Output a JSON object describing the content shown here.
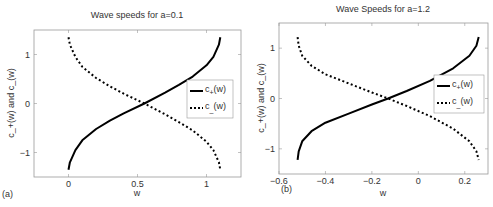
{
  "figure": {
    "panel_a_label": "(a)",
    "panel_b_label": "(b)"
  },
  "chart_data": [
    {
      "type": "line",
      "panel": "(a)",
      "title": "Wave speeds for a=0.1",
      "xlabel": "w",
      "ylabel": "c_+(w) and c_(w)",
      "xlim": [
        -0.25,
        1.25
      ],
      "ylim": [
        -1.5,
        1.5
      ],
      "xticks": [
        0,
        0.5,
        1
      ],
      "xtick_labels": [
        "0",
        "0.5",
        "1"
      ],
      "yticks": [
        -1,
        0,
        1
      ],
      "ytick_labels": [
        "-1",
        "0",
        "1"
      ],
      "grid": false,
      "legend": {
        "position": "right-center",
        "entries": [
          "c+(w)",
          "c-(w)"
        ]
      },
      "series": [
        {
          "name": "c+(w)",
          "style": "solid",
          "x": [
            0.0,
            0.01,
            0.05,
            0.1,
            0.2,
            0.3,
            0.4,
            0.55,
            0.7,
            0.8,
            0.9,
            1.0,
            1.05,
            1.09,
            1.1
          ],
          "y": [
            -1.35,
            -1.2,
            -0.95,
            -0.75,
            -0.52,
            -0.35,
            -0.2,
            0.0,
            0.22,
            0.38,
            0.55,
            0.78,
            0.95,
            1.2,
            1.35
          ]
        },
        {
          "name": "c-(w)",
          "style": "dashed",
          "x": [
            0.0,
            0.01,
            0.05,
            0.1,
            0.2,
            0.3,
            0.4,
            0.55,
            0.7,
            0.8,
            0.9,
            1.0,
            1.05,
            1.09,
            1.1
          ],
          "y": [
            1.35,
            1.2,
            0.95,
            0.75,
            0.52,
            0.35,
            0.2,
            0.0,
            -0.22,
            -0.38,
            -0.55,
            -0.78,
            -0.95,
            -1.2,
            -1.35
          ]
        }
      ]
    },
    {
      "type": "line",
      "panel": "(b)",
      "title": "Wave Speeds for a=1.2",
      "xlabel": "w",
      "ylabel": "c_+(w) and c_(w)",
      "xlim": [
        -0.6,
        0.3
      ],
      "ylim": [
        -1.5,
        1.5
      ],
      "xticks": [
        -0.6,
        -0.4,
        -0.2,
        0,
        0.2
      ],
      "xtick_labels": [
        "-0.6",
        "-0.4",
        "-0.2",
        "0",
        "0.2"
      ],
      "yticks": [
        -1,
        0,
        1
      ],
      "ytick_labels": [
        "-1",
        "0",
        "1"
      ],
      "grid": false,
      "legend": {
        "position": "right-center",
        "entries": [
          "c+(w)",
          "c-(w)"
        ]
      },
      "series": [
        {
          "name": "c+(w)",
          "style": "solid",
          "x": [
            -0.52,
            -0.515,
            -0.5,
            -0.46,
            -0.4,
            -0.3,
            -0.2,
            -0.13,
            -0.05,
            0.05,
            0.15,
            0.22,
            0.25,
            0.26
          ],
          "y": [
            -1.22,
            -1.05,
            -0.85,
            -0.65,
            -0.48,
            -0.3,
            -0.12,
            0.0,
            0.15,
            0.35,
            0.6,
            0.85,
            1.05,
            1.22
          ]
        },
        {
          "name": "c-(w)",
          "style": "dashed",
          "x": [
            -0.52,
            -0.515,
            -0.5,
            -0.46,
            -0.4,
            -0.3,
            -0.2,
            -0.13,
            -0.05,
            0.05,
            0.15,
            0.22,
            0.25,
            0.26
          ],
          "y": [
            1.22,
            1.05,
            0.85,
            0.65,
            0.48,
            0.3,
            0.12,
            0.0,
            -0.15,
            -0.35,
            -0.6,
            -0.85,
            -1.05,
            -1.22
          ]
        }
      ]
    }
  ]
}
